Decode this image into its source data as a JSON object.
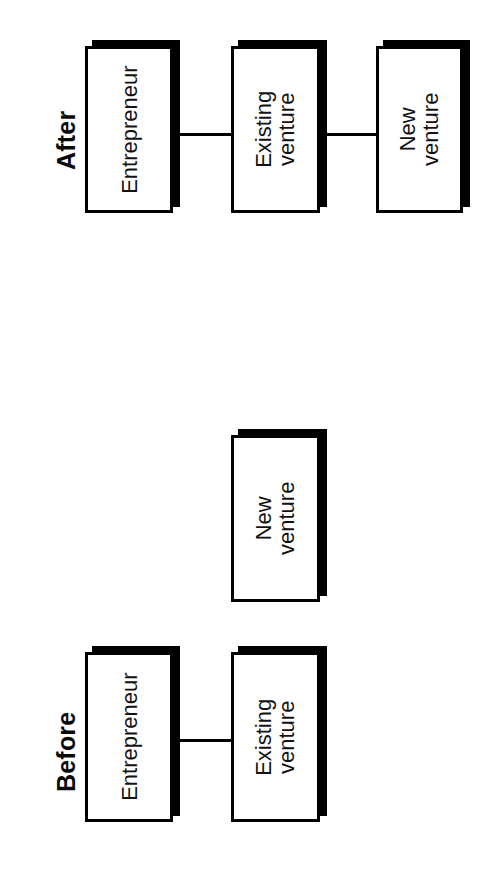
{
  "figure": {
    "type": "flow-diagram",
    "orientation": "rotated-90-ccw",
    "background_color": "#ffffff",
    "line_color": "#000000",
    "box_fill_color": "#ffffff",
    "shadow_color": "#000000"
  },
  "sections": [
    {
      "id": "after",
      "label": "After",
      "nodes": [
        {
          "id": "after-entrepreneur",
          "label": "Entrepreneur"
        },
        {
          "id": "after-existing-venture",
          "label": "Existing\nventure"
        },
        {
          "id": "after-new-venture",
          "label": "New\nventure"
        }
      ],
      "connections": [
        {
          "from": "after-entrepreneur",
          "to": "after-existing-venture"
        },
        {
          "from": "after-existing-venture",
          "to": "after-new-venture"
        }
      ]
    },
    {
      "id": "before",
      "label": "Before",
      "nodes": [
        {
          "id": "before-new-venture",
          "label": "New\nventure"
        },
        {
          "id": "before-entrepreneur",
          "label": "Entrepreneur"
        },
        {
          "id": "before-existing-venture",
          "label": "Existing\nventure"
        }
      ],
      "connections": [
        {
          "from": "before-entrepreneur",
          "to": "before-existing-venture"
        }
      ]
    }
  ],
  "labels": {
    "after_section": "After",
    "before_section": "Before",
    "entrepreneur": "Entrepreneur",
    "existing_venture": "Existing\nventure",
    "new_venture": "New\nventure"
  }
}
